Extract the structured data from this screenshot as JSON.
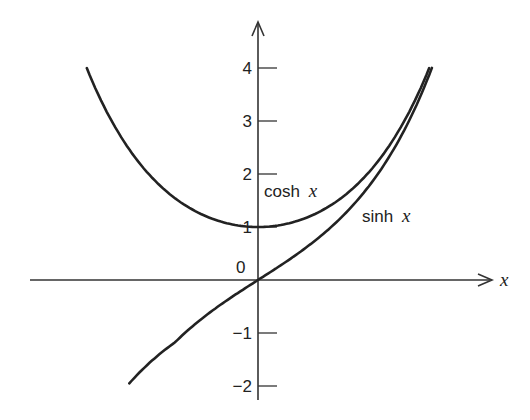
{
  "chart_data": {
    "type": "line",
    "title": "",
    "xlabel": "x",
    "ylabel": "",
    "ylim": [
      -2,
      4
    ],
    "xlim": [
      -2.06,
      2.1
    ],
    "grid": false,
    "legend": "inline labels on curves",
    "y_ticks": [
      {
        "value": 4,
        "label": "4"
      },
      {
        "value": 3,
        "label": "3"
      },
      {
        "value": 2,
        "label": "2"
      },
      {
        "value": 1,
        "label": "1"
      },
      {
        "value": -1,
        "label": "−1"
      },
      {
        "value": -2,
        "label": "−2"
      }
    ],
    "origin_label": "0",
    "series": [
      {
        "name": "cosh x",
        "label_text": "cosh",
        "label_var": "x",
        "function": "cosh",
        "x_range": [
          -2.063,
          2.063
        ],
        "points": [
          [
            -2.0,
            3.76
          ],
          [
            -1.5,
            2.35
          ],
          [
            -1.0,
            1.54
          ],
          [
            -0.5,
            1.13
          ],
          [
            0.0,
            1.0
          ],
          [
            0.5,
            1.13
          ],
          [
            1.0,
            1.54
          ],
          [
            1.5,
            2.35
          ],
          [
            2.0,
            3.76
          ]
        ]
      },
      {
        "name": "sinh x",
        "label_text": "sinh",
        "label_var": "x",
        "function": "sinh",
        "x_range": [
          -1.55,
          2.095
        ],
        "points": [
          [
            -1.5,
            -2.13
          ],
          [
            -1.0,
            -1.18
          ],
          [
            -0.5,
            -0.52
          ],
          [
            0.0,
            0.0
          ],
          [
            0.5,
            0.52
          ],
          [
            1.0,
            1.18
          ],
          [
            1.5,
            2.13
          ],
          [
            2.0,
            3.63
          ]
        ]
      }
    ]
  },
  "axes": {
    "x_axis_label": "x"
  }
}
